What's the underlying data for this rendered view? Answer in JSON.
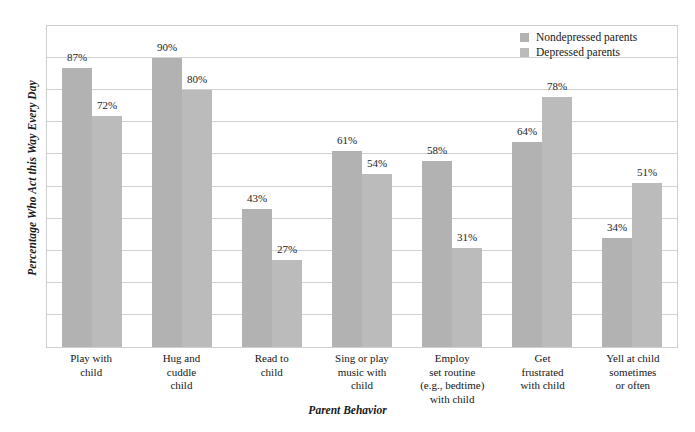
{
  "chart_data": {
    "type": "bar",
    "title": "",
    "xlabel": "Parent Behavior",
    "ylabel": "Percentage Who Act this Way Every Day",
    "ylim": [
      0,
      100
    ],
    "grid": true,
    "gridline_interval": 10,
    "legend_position": "top-right",
    "value_label_suffix": "%",
    "categories": [
      "Play with child",
      "Hug and cuddle child",
      "Read to child",
      "Sing or play music with child",
      "Employ set routine (e.g., bedtime) with child",
      "Get frustrated with child",
      "Yell at child sometimes or often"
    ],
    "category_lines": [
      [
        "Play with",
        "child"
      ],
      [
        "Hug and",
        "cuddle",
        "child"
      ],
      [
        "Read to",
        "child"
      ],
      [
        "Sing or play",
        "music with",
        "child"
      ],
      [
        "Employ",
        "set routine",
        "(e.g., bedtime)",
        "with child"
      ],
      [
        "Get",
        "frustrated",
        "with child"
      ],
      [
        "Yell at child",
        "sometimes",
        "or often"
      ]
    ],
    "series": [
      {
        "name": "Nondepressed parents",
        "color": "#b2b2b2",
        "values": [
          87,
          90,
          43,
          61,
          58,
          64,
          34
        ],
        "labels": [
          "87%",
          "90%",
          "43%",
          "61%",
          "58%",
          "64%",
          "34%"
        ]
      },
      {
        "name": "Depressed parents",
        "color": "#bbbbbb",
        "values": [
          72,
          80,
          27,
          54,
          31,
          78,
          51
        ],
        "labels": [
          "72%",
          "80%",
          "27%",
          "54%",
          "31%",
          "78%",
          "51%"
        ]
      }
    ]
  },
  "legend": {
    "items": [
      {
        "label": "Nondepressed parents"
      },
      {
        "label": "Depressed parents"
      }
    ]
  }
}
